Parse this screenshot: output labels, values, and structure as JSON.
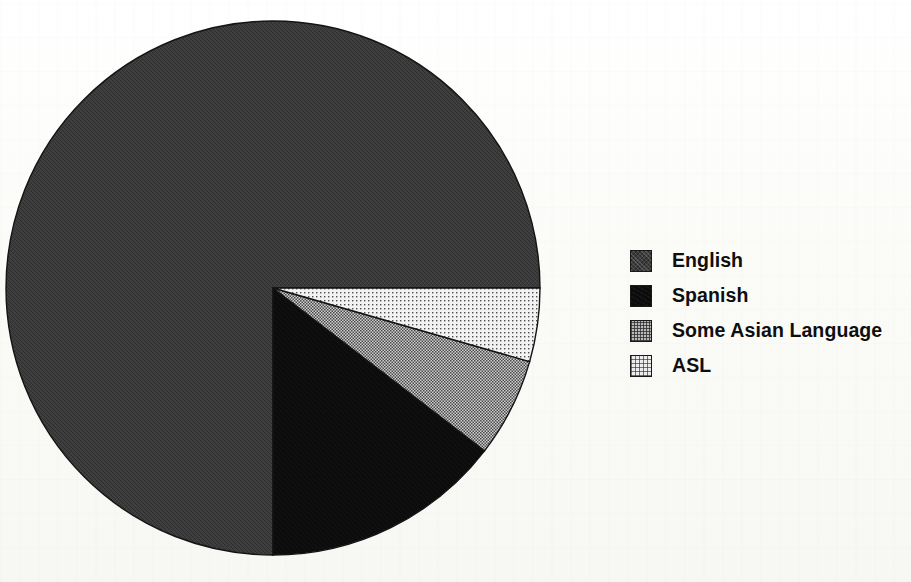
{
  "chart_data": {
    "type": "pie",
    "title": "",
    "subtitle": "",
    "xlabel": "",
    "ylabel": "",
    "grid": false,
    "legend_position": "right",
    "start_angle_deg": 0,
    "direction": "clockwise",
    "center": {
      "x": 273,
      "y": 288
    },
    "radius": 267,
    "labels": [
      "English",
      "Spanish",
      "Some Asian Language",
      "ASL"
    ],
    "values": [
      75.0,
      14.6,
      6.0,
      4.4
    ],
    "value_unit": "percent",
    "angles_deg": [
      270.0,
      52.4,
      21.6,
      16.0
    ],
    "slices": [
      {
        "label": "English",
        "value": 75.0,
        "start_angle_deg": 90,
        "end_angle_deg": 360,
        "sweep_deg": 270.0,
        "fill": "dark-gray-noise",
        "color": "#3c3c3c"
      },
      {
        "label": "Spanish",
        "value": 14.6,
        "start_angle_deg": 37.6,
        "end_angle_deg": 90,
        "sweep_deg": 52.4,
        "fill": "solid-black",
        "color": "#0c0c0c"
      },
      {
        "label": "Some Asian Language",
        "value": 6.0,
        "start_angle_deg": 16.0,
        "end_angle_deg": 37.6,
        "sweep_deg": 21.6,
        "fill": "medium-gray-checker",
        "color": "#b9b9b9"
      },
      {
        "label": "ASL",
        "value": 4.4,
        "start_angle_deg": 0,
        "end_angle_deg": 16.0,
        "sweep_deg": 16.0,
        "fill": "light-gray-dots",
        "color": "#ededed"
      }
    ]
  },
  "legend": {
    "items": [
      {
        "label": "English",
        "swatch": "fill-english",
        "swatch_name": "legend-swatch-english"
      },
      {
        "label": "Spanish",
        "swatch": "fill-spanish",
        "swatch_name": "legend-swatch-spanish"
      },
      {
        "label": "Some Asian Language",
        "swatch": "fill-asian",
        "swatch_name": "legend-swatch-some-asian-language"
      },
      {
        "label": "ASL",
        "swatch": "fill-asl",
        "swatch_name": "legend-swatch-asl"
      }
    ]
  },
  "colors": {
    "background": "#fdfdfb",
    "outline": "#191919",
    "text": "#0e0e0e",
    "english": "#3c3c3c",
    "spanish": "#0c0c0c",
    "some_asian_language": "#b9b9b9",
    "asl": "#ededed"
  }
}
